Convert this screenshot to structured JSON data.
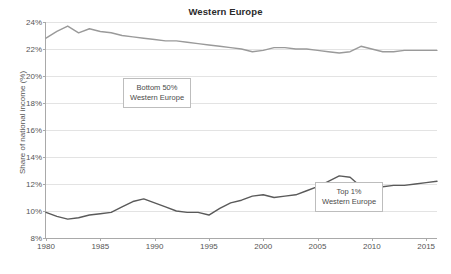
{
  "chart_data": {
    "type": "line",
    "title": "Western Europe",
    "xlabel": "",
    "ylabel": "Share of national income (%)",
    "xlim": [
      1980,
      2016
    ],
    "ylim": [
      8,
      24
    ],
    "xticks": [
      1980,
      1985,
      1990,
      1995,
      2000,
      2005,
      2010,
      2015
    ],
    "yticks": [
      8,
      10,
      12,
      14,
      16,
      18,
      20,
      22,
      24
    ],
    "ytick_labels": [
      "8%",
      "10%",
      "12%",
      "14%",
      "16%",
      "18%",
      "20%",
      "22%",
      "24%"
    ],
    "grid": true,
    "legend": "annotations",
    "series": [
      {
        "name": "Bottom 50% Western Europe",
        "color": "#9a9a9a",
        "x": [
          1980,
          1981,
          1982,
          1983,
          1984,
          1985,
          1986,
          1987,
          1988,
          1989,
          1990,
          1991,
          1992,
          1993,
          1994,
          1995,
          1996,
          1997,
          1998,
          1999,
          2000,
          2001,
          2002,
          2003,
          2004,
          2005,
          2006,
          2007,
          2008,
          2009,
          2010,
          2011,
          2012,
          2013,
          2014,
          2015,
          2016
        ],
        "values": [
          22.8,
          23.3,
          23.7,
          23.2,
          23.5,
          23.3,
          23.2,
          23.0,
          22.9,
          22.8,
          22.7,
          22.6,
          22.6,
          22.5,
          22.4,
          22.3,
          22.2,
          22.1,
          22.0,
          21.8,
          21.9,
          22.1,
          22.1,
          22.0,
          22.0,
          21.9,
          21.8,
          21.7,
          21.8,
          22.2,
          22.0,
          21.8,
          21.8,
          21.9,
          21.9,
          21.9,
          21.9
        ]
      },
      {
        "name": "Top 1% Western Europe",
        "color": "#5a5a5a",
        "x": [
          1980,
          1981,
          1982,
          1983,
          1984,
          1985,
          1986,
          1987,
          1988,
          1989,
          1990,
          1991,
          1992,
          1993,
          1994,
          1995,
          1996,
          1997,
          1998,
          1999,
          2000,
          2001,
          2002,
          2003,
          2004,
          2005,
          2006,
          2007,
          2008,
          2009,
          2010,
          2011,
          2012,
          2013,
          2014,
          2015,
          2016
        ],
        "values": [
          9.9,
          9.6,
          9.4,
          9.5,
          9.7,
          9.8,
          9.9,
          10.3,
          10.7,
          10.9,
          10.6,
          10.3,
          10.0,
          9.9,
          9.9,
          9.7,
          10.2,
          10.6,
          10.8,
          11.1,
          11.2,
          11.0,
          11.1,
          11.2,
          11.5,
          11.8,
          12.2,
          12.6,
          12.5,
          11.8,
          12.0,
          11.8,
          11.9,
          11.9,
          12.0,
          12.1,
          12.2
        ]
      }
    ],
    "annotations": [
      {
        "id": "bottom50",
        "text": "Bottom 50%\nWestern Europe"
      },
      {
        "id": "top1",
        "text": "Top 1%\nWestern Europe"
      }
    ]
  }
}
